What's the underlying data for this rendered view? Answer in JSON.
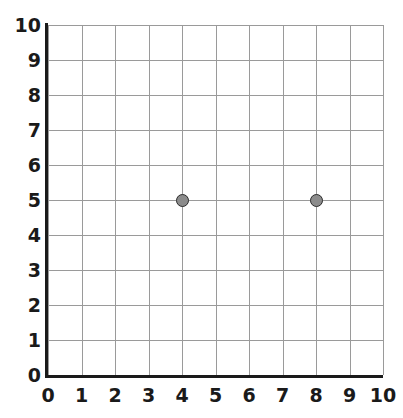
{
  "chart_data": {
    "type": "scatter",
    "title": "",
    "subtitle": "",
    "xlabel": "",
    "ylabel": "",
    "xlim": [
      0,
      10
    ],
    "ylim": [
      0,
      10
    ],
    "x_ticks": [
      0,
      1,
      2,
      3,
      4,
      5,
      6,
      7,
      8,
      9,
      10
    ],
    "y_ticks": [
      0,
      1,
      2,
      3,
      4,
      5,
      6,
      7,
      8,
      9,
      10
    ],
    "x_tick_labels": [
      "0",
      "1",
      "2",
      "3",
      "4",
      "5",
      "6",
      "7",
      "8",
      "9",
      "10"
    ],
    "y_tick_labels": [
      "0",
      "1",
      "2",
      "3",
      "4",
      "5",
      "6",
      "7",
      "8",
      "9",
      "10"
    ],
    "grid": true,
    "grid_step": 1,
    "legend": "none",
    "annotations": [],
    "points": [
      {
        "label": "point-1",
        "x": 4,
        "y": 5
      },
      {
        "label": "point-2",
        "x": 8,
        "y": 5
      }
    ],
    "series": [
      {
        "name": "points",
        "x": [
          4,
          8
        ],
        "y": [
          5,
          5
        ]
      }
    ]
  },
  "style": {
    "marker_fill": "#8c8c8c",
    "marker_edge": "#2b2b2b",
    "grid_color": "#9a9a9a",
    "axis_color": "#1a1a1a",
    "background": "#ffffff"
  }
}
